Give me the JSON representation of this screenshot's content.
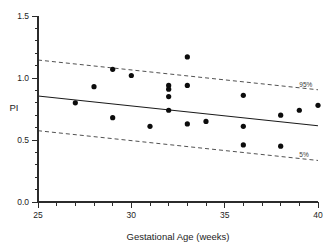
{
  "chart_data": {
    "type": "scatter",
    "title": "",
    "xlabel": "Gestational Age (weeks)",
    "ylabel": "PI",
    "xlim": [
      25,
      40
    ],
    "ylim": [
      0.0,
      1.5
    ],
    "xticks": [
      25,
      30,
      35,
      40
    ],
    "xtick_labels": [
      "25",
      "30",
      "35",
      "40"
    ],
    "xtick_minor_step": 1,
    "yticks": [
      0.0,
      0.5,
      1.0,
      1.5
    ],
    "ytick_labels": [
      "0.0",
      "0.5",
      "1.0",
      "1.5"
    ],
    "ytick_minor_step": 0.1,
    "grid": false,
    "legend_position": "inline-right",
    "points": [
      {
        "x": 27.0,
        "y": 0.8
      },
      {
        "x": 28.0,
        "y": 0.93
      },
      {
        "x": 29.0,
        "y": 1.07
      },
      {
        "x": 29.0,
        "y": 0.68
      },
      {
        "x": 30.0,
        "y": 1.02
      },
      {
        "x": 31.0,
        "y": 0.61
      },
      {
        "x": 32.0,
        "y": 0.94
      },
      {
        "x": 32.0,
        "y": 0.91
      },
      {
        "x": 32.0,
        "y": 0.85
      },
      {
        "x": 32.0,
        "y": 0.74
      },
      {
        "x": 33.0,
        "y": 1.17
      },
      {
        "x": 33.0,
        "y": 0.94
      },
      {
        "x": 33.0,
        "y": 0.63
      },
      {
        "x": 34.0,
        "y": 0.65
      },
      {
        "x": 36.0,
        "y": 0.86
      },
      {
        "x": 36.0,
        "y": 0.61
      },
      {
        "x": 36.0,
        "y": 0.46
      },
      {
        "x": 38.0,
        "y": 0.7
      },
      {
        "x": 38.0,
        "y": 0.45
      },
      {
        "x": 39.0,
        "y": 0.74
      },
      {
        "x": 40.0,
        "y": 0.78
      }
    ],
    "series": [
      {
        "name": "regression",
        "style": "solid",
        "x": [
          25,
          40
        ],
        "values": [
          0.855,
          0.615
        ]
      },
      {
        "name": "95%",
        "style": "dashed",
        "x": [
          25,
          40
        ],
        "values": [
          1.145,
          0.905
        ]
      },
      {
        "name": "5%",
        "style": "dashed",
        "x": [
          25,
          40
        ],
        "values": [
          0.575,
          0.335
        ]
      }
    ],
    "annotations": [
      {
        "text": "95%",
        "x": 39.0,
        "y": 0.93
      },
      {
        "text": "5%",
        "x": 39.0,
        "y": 0.36
      }
    ]
  }
}
